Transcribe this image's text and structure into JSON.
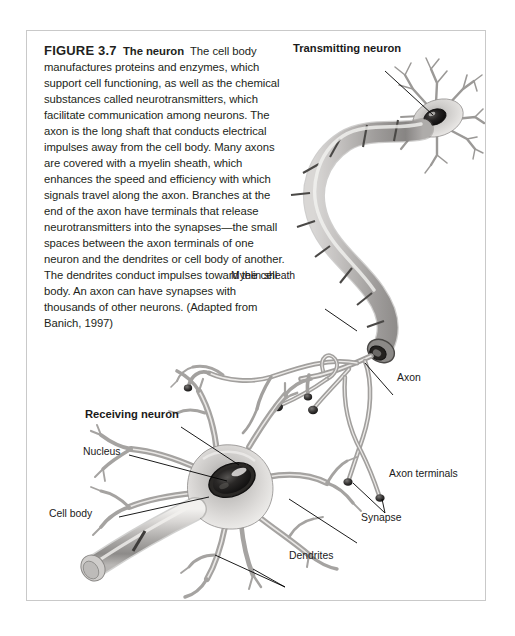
{
  "figure": {
    "number": "FIGURE 3.7",
    "title": "The neuron",
    "caption": "The cell body manufactures proteins and enzymes, which support cell functioning, as well as the chemical substances called neurotransmitters, which facilitate communication among neurons. The axon is the long shaft that conducts electrical impulses away from the cell body. Many axons are covered with a myelin sheath, which enhances the speed and efficiency with which signals travel along the axon. Branches at the end of the axon have terminals that release neurotransmitters into the synapses—the small spaces between the axon terminals of one neuron and the dendrites or cell body of another. The dendrites conduct impulses toward the cell body. An axon can have synapses with thousands of other neurons. (Adapted from Banich, 1997)"
  },
  "diagram": {
    "alt": "Illustration of two neurons: a transmitting neuron at upper right whose myelinated axon curves down to axon terminals that synapse onto the dendrites and cell body of a receiving neuron at lower left.",
    "labels": {
      "transmitting_neuron": "Transmitting neuron",
      "myelin_sheath": "Myelin sheath",
      "axon": "Axon",
      "axon_terminals": "Axon terminals",
      "synapse": "Synapse",
      "receiving_neuron": "Receiving neuron",
      "nucleus": "Nucleus",
      "cell_body": "Cell body",
      "dendrites": "Dendrites"
    }
  },
  "colors": {
    "panel_border": "#c9c9c9",
    "text": "#231f20",
    "label_text": "#1a1a1a",
    "leader_line": "#000000",
    "cell_fill_light": "#e3e2e0",
    "cell_fill_mid": "#b9b7b5",
    "cell_fill_dark": "#6e6c6b",
    "nucleus": "#1c1b1b",
    "background": "#ffffff"
  }
}
